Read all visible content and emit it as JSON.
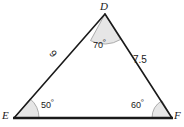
{
  "figure": {
    "type": "triangle",
    "background_color": "#ffffff",
    "stroke_color": "#1a1a1a",
    "arc_fill_color": "#e6e6e6",
    "arc_stroke_color": "#9a9a9a",
    "vertices": [
      {
        "name": "D",
        "label": "D",
        "x": 105,
        "y": 14,
        "angle_value": "70",
        "angle_unit": "º",
        "angle_label": "70º"
      },
      {
        "name": "E",
        "label": "E",
        "x": 14,
        "y": 118,
        "angle_value": "50",
        "angle_unit": "º",
        "angle_label": "50º"
      },
      {
        "name": "F",
        "label": "F",
        "x": 172,
        "y": 118,
        "angle_value": "60",
        "angle_unit": "º",
        "angle_label": "60º"
      }
    ],
    "sides": [
      {
        "name": "DE",
        "label": "9",
        "from": "D",
        "to": "E"
      },
      {
        "name": "DF",
        "label": "7.5",
        "from": "D",
        "to": "F"
      },
      {
        "name": "EF",
        "label": "",
        "from": "E",
        "to": "F"
      }
    ]
  }
}
